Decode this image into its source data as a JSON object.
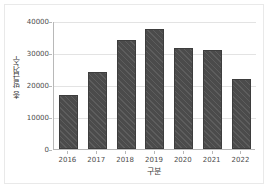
{
  "chart_data": {
    "type": "bar",
    "title": "",
    "subtitle": "",
    "xlabel": "구분",
    "ylabel": "총 발급건수",
    "categories": [
      "2016",
      "2017",
      "2018",
      "2019",
      "2020",
      "2021",
      "2022"
    ],
    "values": [
      17000,
      24000,
      34000,
      37500,
      31500,
      30800,
      21800
    ],
    "series": [
      {
        "name": "총 발급건수",
        "values": [
          17000,
          24000,
          34000,
          37500,
          31500,
          30800,
          21800
        ]
      }
    ],
    "ylim": [
      0,
      40000
    ],
    "yticks": [
      "0",
      "10000",
      "20000",
      "30000",
      "40000"
    ],
    "ytick_values": [
      0,
      10000,
      20000,
      30000,
      40000
    ],
    "grid": true,
    "grid_axis": "y",
    "legend": false,
    "legend_position": "none",
    "bar_color": "#4b4b4b",
    "bar_hatch": "diagonal",
    "grid_color": "#e3e3e3",
    "axis_color": "#b8b8b8",
    "background_color": "#ffffff"
  }
}
